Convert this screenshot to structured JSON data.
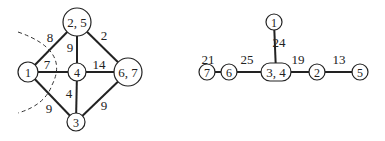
{
  "left_graph": {
    "nodes": [
      {
        "id": "1",
        "label": "1",
        "x": 28,
        "y": 72,
        "r": 10
      },
      {
        "id": "25",
        "label": "2, 5",
        "x": 77,
        "y": 22,
        "r": 14
      },
      {
        "id": "4",
        "label": "4",
        "x": 77,
        "y": 72,
        "r": 9
      },
      {
        "id": "67",
        "label": "6, 7",
        "x": 128,
        "y": 72,
        "r": 14
      },
      {
        "id": "3",
        "label": "3",
        "x": 76,
        "y": 122,
        "r": 9
      }
    ],
    "edges": [
      {
        "from": "1",
        "to": "25",
        "weight": "8",
        "lx": 50,
        "ly": 42
      },
      {
        "from": "25",
        "to": "4",
        "weight": "9",
        "lx": 70,
        "ly": 52
      },
      {
        "from": "25",
        "to": "67",
        "weight": "2",
        "lx": 104,
        "ly": 40
      },
      {
        "from": "1",
        "to": "4",
        "weight": "7",
        "lx": 47,
        "ly": 69
      },
      {
        "from": "4",
        "to": "67",
        "weight": "14",
        "lx": 99,
        "ly": 69
      },
      {
        "from": "4",
        "to": "3",
        "weight": "4",
        "lx": 69,
        "ly": 98
      },
      {
        "from": "1",
        "to": "3",
        "weight": "9",
        "lx": 49,
        "ly": 113
      },
      {
        "from": "67",
        "to": "3",
        "weight": "9",
        "lx": 104,
        "ly": 110
      }
    ]
  },
  "right_graph": {
    "nodes": [
      {
        "id": "7",
        "label": "7",
        "x": 207,
        "y": 72,
        "r": 8,
        "w": 0
      },
      {
        "id": "6",
        "label": "6",
        "x": 229,
        "y": 72,
        "r": 8,
        "w": 0
      },
      {
        "id": "34",
        "label": "3, 4",
        "x": 276,
        "y": 72,
        "r": 9,
        "w": 30
      },
      {
        "id": "2",
        "label": "2",
        "x": 317,
        "y": 72,
        "r": 8,
        "w": 0
      },
      {
        "id": "5",
        "label": "5",
        "x": 360,
        "y": 72,
        "r": 8,
        "w": 0
      },
      {
        "id": "1",
        "label": "1",
        "x": 274,
        "y": 22,
        "r": 8,
        "w": 0
      }
    ],
    "edges": [
      {
        "from": "7",
        "to": "6",
        "weight": "21",
        "lx": 208,
        "ly": 64
      },
      {
        "from": "6",
        "to": "34",
        "weight": "25",
        "lx": 247,
        "ly": 64
      },
      {
        "from": "34",
        "to": "2",
        "weight": "19",
        "lx": 298,
        "ly": 64
      },
      {
        "from": "2",
        "to": "5",
        "weight": "13",
        "lx": 339,
        "ly": 64
      },
      {
        "from": "1",
        "to": "34",
        "weight": "24",
        "lx": 279,
        "ly": 47
      }
    ]
  }
}
